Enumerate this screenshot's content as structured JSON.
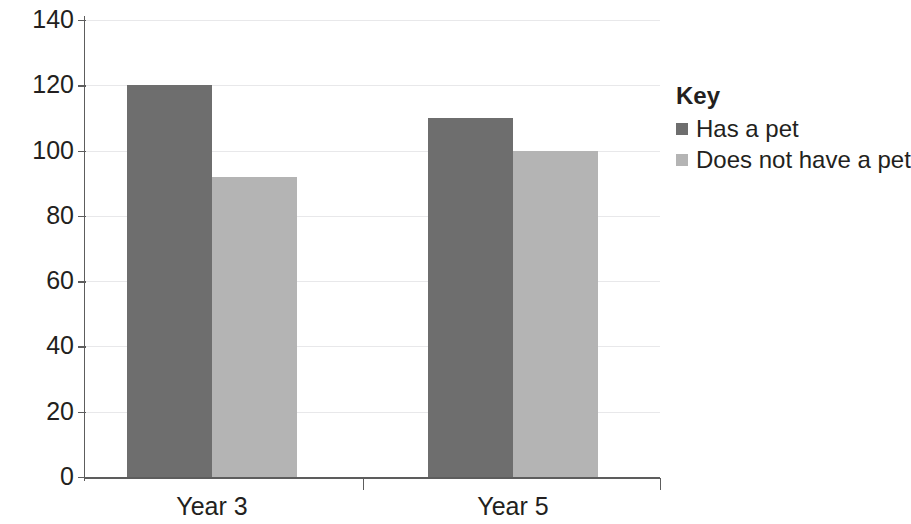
{
  "chart_data": {
    "type": "bar",
    "title": "",
    "xlabel": "",
    "ylabel": "",
    "categories": [
      "Year 3",
      "Year 5"
    ],
    "series": [
      {
        "name": "Has a pet",
        "values": [
          120,
          110
        ],
        "color": "#6e6e6e"
      },
      {
        "name": "Does not have a pet",
        "values": [
          92,
          100
        ],
        "color": "#b4b4b4"
      }
    ],
    "ylim": [
      0,
      140
    ],
    "ytick_step": 20,
    "ytick_labels": [
      "140",
      "120",
      "100",
      "80",
      "60",
      "40",
      "20",
      "0"
    ],
    "ytick_values": [
      140,
      120,
      100,
      80,
      60,
      40,
      20,
      0
    ],
    "grid": true,
    "grid_axis": "y",
    "legend_position": "right"
  },
  "legend": {
    "title": "Key",
    "entries": [
      {
        "label": "Has a pet",
        "color": "#6e6e6e"
      },
      {
        "label": "Does not have a pet",
        "color": "#b4b4b4"
      }
    ]
  },
  "axis": {
    "line_color": "#5d5d5d",
    "grid_color": "#e8e8ea"
  }
}
